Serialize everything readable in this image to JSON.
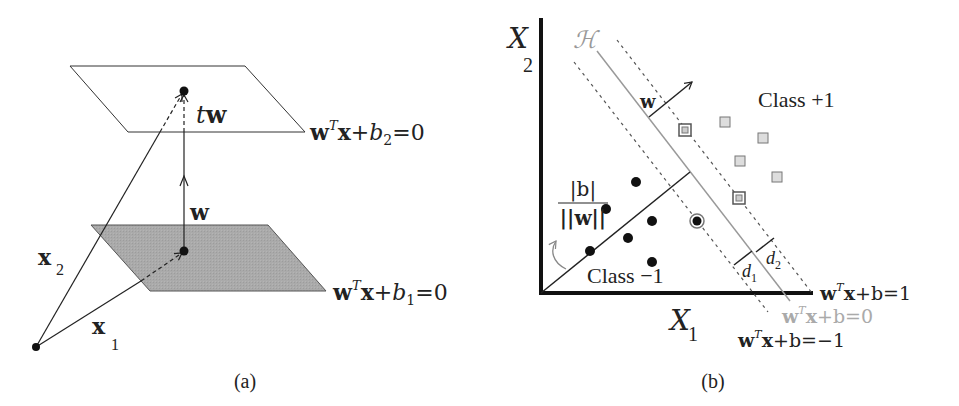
{
  "panel_a": {
    "caption": "(a)",
    "labels": {
      "tw_t": "t",
      "tw_w": "w",
      "w": "w",
      "x2": "x",
      "x2_sub": "2",
      "x1": "x",
      "x1_sub": "1"
    },
    "eq_top": {
      "w": "w",
      "sup": "T",
      "x": "x",
      "plus": "+",
      "b": "b",
      "sub": "2",
      "rest": "=0"
    },
    "eq_bottom": {
      "w": "w",
      "sup": "T",
      "x": "x",
      "plus": "+",
      "b": "b",
      "sub": "1",
      "rest": "=0"
    },
    "colors": {
      "top_plane_fill": "#ffffff",
      "bottom_plane_fill": "#a9a9a9",
      "stroke": "#222222"
    }
  },
  "panel_b": {
    "caption": "(b)",
    "axis_x": {
      "name": "X",
      "sub": "1"
    },
    "axis_y": {
      "name": "X",
      "sub": "2"
    },
    "hyperplane_label": "ℋ",
    "w_label": "w",
    "class_pos": "Class +1",
    "class_neg": "Class −1",
    "bias": {
      "num": "|b|",
      "den": "||w||"
    },
    "d1": {
      "d": "d",
      "sub": "1"
    },
    "d2": {
      "d": "d",
      "sub": "2"
    },
    "eq_pos": {
      "w": "w",
      "sup": "T",
      "x": "x",
      "rest": "+b=1"
    },
    "eq_zero": {
      "w": "w",
      "sup": "T",
      "x": "x",
      "rest": "+b=0"
    },
    "eq_neg": {
      "w": "w",
      "sup": "T",
      "x": "x",
      "rest": "+b=−1"
    },
    "colors": {
      "hyperplane": "#999999",
      "margin": "#555555",
      "point": "#111111",
      "square_fill": "#dddddd",
      "square_stroke": "#777777"
    },
    "class_neg_points": [
      [
        636,
        182
      ],
      [
        606,
        209
      ],
      [
        652,
        221
      ],
      [
        628,
        238
      ],
      [
        590,
        251
      ],
      [
        652,
        262
      ]
    ],
    "class_neg_support": [
      [
        697,
        221
      ]
    ],
    "class_pos_points": [
      [
        725,
        122
      ],
      [
        763,
        138
      ],
      [
        740,
        161
      ],
      [
        777,
        177
      ]
    ],
    "class_pos_support": [
      [
        685,
        130
      ],
      [
        739,
        198
      ]
    ]
  }
}
